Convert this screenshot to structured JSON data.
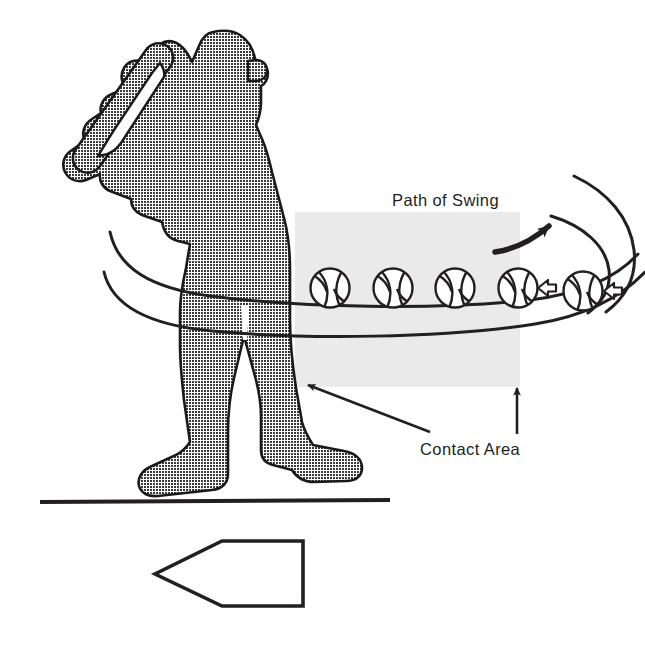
{
  "figure": {
    "background_color": "#ffffff",
    "width": 645,
    "height": 654,
    "labels": {
      "path_of_swing": "Path of Swing",
      "contact_area": "Contact Area"
    },
    "colors": {
      "ink": "#231f20",
      "silhouette_fill": "#808080",
      "silhouette_outline": "#1a1a1a",
      "contact_area_fill": "#eaeaea",
      "baseball_fill": "#ffffff",
      "ground_line": "#231f20"
    },
    "elements": {
      "batter": {
        "name": "batter-silhouette",
        "description": "Dithered gray silhouette of a right-handed batter holding a bat up behind the shoulder, viewed from the front",
        "fill_style": "halftone-dither-gray"
      },
      "contact_area_rect": {
        "name": "contact-area-rectangle",
        "x": 295,
        "y": 212,
        "width": 225,
        "height": 175,
        "fill": "#eaeaea"
      },
      "swing_path": {
        "name": "swing-path-curves",
        "description": "Two long sweeping curves forming the swing plane band that wraps from behind the batter around to the right",
        "curve_count": 4,
        "stroke_width": 3
      },
      "direction_arrow": {
        "name": "swing-direction-arrow",
        "description": "Curved black arrow above the swing band pointing up and to the right indicating swing direction"
      },
      "baseballs": {
        "name": "baseball-sequence",
        "count": 5,
        "description": "Five baseballs with seam stitching arranged along the swing band inside and just past the contact area",
        "positions": [
          {
            "cx": 330,
            "cy": 288,
            "r": 20
          },
          {
            "cx": 393,
            "cy": 288,
            "r": 20
          },
          {
            "cx": 455,
            "cy": 288,
            "r": 20
          },
          {
            "cx": 518,
            "cy": 288,
            "r": 20
          },
          {
            "cx": 583,
            "cy": 291,
            "r": 20
          }
        ]
      },
      "incoming_pitch_arrows": {
        "name": "incoming-pitch-arrows",
        "count": 2,
        "description": "Two small hollow block arrows pointing left showing the incoming pitch direction",
        "positions": [
          {
            "x": 545,
            "y": 288
          },
          {
            "x": 611,
            "y": 291
          }
        ]
      },
      "contact_area_leader_diagonal": {
        "name": "contact-area-leader-diagonal",
        "description": "Straight leader line with arrowhead pointing up-left from the Contact Area label into the gray band"
      },
      "contact_area_leader_vertical": {
        "name": "contact-area-leader-vertical",
        "description": "Straight vertical leader line with arrowhead pointing up from the Contact Area label to the bottom edge of the gray rectangle"
      },
      "ground_line": {
        "name": "ground-line",
        "x1": 40,
        "y1": 502,
        "x2": 390,
        "y2": 500,
        "stroke_width": 4
      },
      "home_plate": {
        "name": "home-plate-outline",
        "description": "Outline of home plate pointing to the left, drawn in plan view below the ground line",
        "points": "303,541 303,606 222,606 155,574 222,541"
      }
    }
  }
}
